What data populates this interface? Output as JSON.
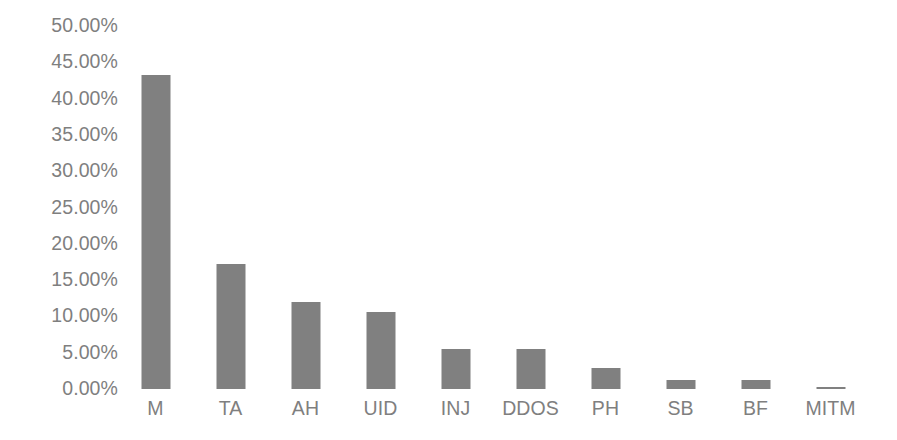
{
  "chart_data": {
    "type": "bar",
    "title": "",
    "subtitle": "",
    "xlabel": "",
    "ylabel": "",
    "categories": [
      "M",
      "TA",
      "AH",
      "UID",
      "INJ",
      "DDOS",
      "PH",
      "SB",
      "BF",
      "MITM"
    ],
    "values": [
      43.2,
      17.2,
      12.0,
      10.6,
      5.5,
      5.5,
      2.9,
      1.2,
      1.2,
      0.3
    ],
    "value_labels": [
      "43.20%",
      "17.20%",
      "12.00%",
      "10.60%",
      "5.50%",
      "5.50%",
      "2.90%",
      "1.20%",
      "1.20%",
      "0.30%"
    ],
    "ylim": [
      0,
      50
    ],
    "ytick_values": [
      50,
      45,
      40,
      35,
      30,
      25,
      20,
      15,
      10,
      5,
      0
    ],
    "ytick_labels": [
      "50.00%",
      "45.00%",
      "40.00%",
      "35.00%",
      "30.00%",
      "25.00%",
      "20.00%",
      "15.00%",
      "10.00%",
      "5.00%",
      "0.00%"
    ],
    "grid": false,
    "legend": false,
    "legend_position": "none",
    "series": [
      {
        "name": "",
        "values": [
          43.2,
          17.2,
          12.0,
          10.6,
          5.5,
          5.5,
          2.9,
          1.2,
          1.2,
          0.3
        ]
      }
    ],
    "colors": {
      "bar": "#808080",
      "tick_label": "#7f7f7f",
      "background": "#ffffff"
    }
  }
}
